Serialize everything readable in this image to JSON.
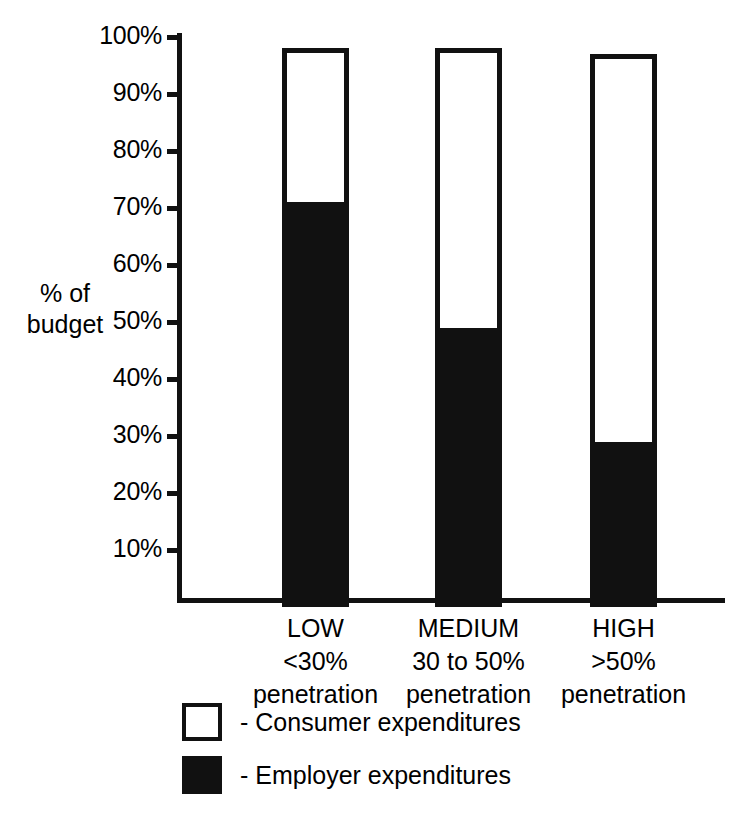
{
  "chart_data": {
    "type": "bar",
    "subtype": "stacked-100-percent",
    "title": "",
    "xlabel": "",
    "ylabel": "% of budget",
    "ylim": [
      0,
      100
    ],
    "ytick_labels": [
      "100%",
      "90%",
      "80%",
      "70%",
      "60%",
      "50%",
      "40%",
      "30%",
      "20%",
      "10%"
    ],
    "ytick_values": [
      100,
      90,
      80,
      70,
      60,
      50,
      40,
      30,
      20,
      10
    ],
    "grid": false,
    "legend_position": "bottom-left",
    "categories": [
      "LOW",
      "MEDIUM",
      "HIGH"
    ],
    "category_sublabels": [
      [
        "<30%",
        "penetration"
      ],
      [
        "30 to 50%",
        "penetration"
      ],
      [
        ">50%",
        "penetration"
      ]
    ],
    "series": [
      {
        "name": "Employer expenditures",
        "color": "#111111",
        "values": [
          71,
          49,
          29
        ]
      },
      {
        "name": "Consumer expenditures",
        "color": "#ffffff",
        "values": [
          29,
          51,
          71
        ]
      }
    ],
    "bar_tops": [
      98,
      98,
      97
    ]
  },
  "axis": {
    "y_title_line1": "% of",
    "y_title_line2": "budget"
  },
  "legend": {
    "items": [
      {
        "swatch": "empty",
        "label": "- Consumer expenditures"
      },
      {
        "swatch": "filled",
        "label": "- Employer expenditures"
      }
    ]
  },
  "colors": {
    "ink": "#111111",
    "paper": "#ffffff"
  }
}
